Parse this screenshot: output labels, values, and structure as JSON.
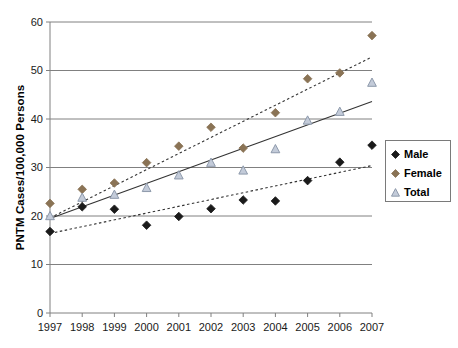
{
  "chart_data": {
    "type": "scatter",
    "title": "",
    "xlabel": "",
    "ylabel": "PNTM Cases/100,000 Persons",
    "categories": [
      "1997",
      "1998",
      "1999",
      "2000",
      "2001",
      "2002",
      "2003",
      "2004",
      "2005",
      "2006",
      "2007"
    ],
    "x": [
      1997,
      1998,
      1999,
      2000,
      2001,
      2002,
      2003,
      2004,
      2005,
      2006,
      2007
    ],
    "xlim": [
      1997,
      2007
    ],
    "ylim": [
      0,
      60
    ],
    "ytick_values": [
      0,
      10,
      20,
      30,
      40,
      50,
      60
    ],
    "ytick_labels": [
      "0",
      "10",
      "20",
      "30",
      "40",
      "50",
      "60"
    ],
    "grid": "horizontal",
    "legend_position": "right",
    "series": [
      {
        "name": "Male",
        "marker": "filled-diamond",
        "color": "#1a1a1a",
        "trendline": "dotted",
        "trendline_color": "#333333",
        "trendline_start": 16.4,
        "trendline_end": 30.4,
        "values": [
          16.8,
          21.9,
          21.4,
          18.1,
          19.9,
          21.5,
          23.3,
          23.1,
          27.3,
          31.1,
          34.6
        ]
      },
      {
        "name": "Female",
        "marker": "filled-diamond",
        "color": "#8a7355",
        "trendline": "dotted",
        "trendline_color": "#333333",
        "trendline_start": 19.6,
        "trendline_end": 52.8,
        "values": [
          22.6,
          25.5,
          26.8,
          31.0,
          34.4,
          38.3,
          34.0,
          41.3,
          48.3,
          49.5,
          57.2
        ]
      },
      {
        "name": "Total",
        "marker": "open-triangle",
        "color": "#c3cbd9",
        "edge_color": "#8d99ab",
        "trendline": "solid",
        "trendline_color": "#333333",
        "trendline_start": 19.5,
        "trendline_end": 43.6,
        "values": [
          20.0,
          23.8,
          24.4,
          25.8,
          28.4,
          31.0,
          29.4,
          33.8,
          39.7,
          41.5,
          47.5
        ]
      }
    ]
  },
  "legend": {
    "items": [
      {
        "label": "Male"
      },
      {
        "label": "Female"
      },
      {
        "label": "Total"
      }
    ]
  },
  "axis": {
    "y_title": "PNTM Cases/100,000 Persons"
  },
  "colors": {
    "male": "#1a1a1a",
    "female": "#8a7355",
    "total_fill": "#c3cbd9",
    "total_edge": "#8d99ab",
    "gridline": "#808080",
    "axis": "#808080",
    "text": "#1a1a1a"
  }
}
